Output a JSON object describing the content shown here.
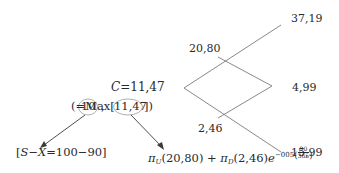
{
  "diagram": {
    "type": "binomial-tree",
    "root": {
      "label": "C = 11.47",
      "c_symbol": "C",
      "c_eq": "=",
      "c_value": "11,47",
      "note": {
        "open": "(",
        "eq": "=",
        "max": "Max[",
        "opt1": "10",
        "comma": ",",
        "opt2": "11,47",
        "close": "])"
      }
    },
    "nodes": {
      "up": "20,80",
      "down": "2,46",
      "uu": "37,19",
      "ud": "4,99",
      "dd": "15,99"
    },
    "annotations": {
      "exercise": {
        "text": "[S−X=100−90]",
        "open": "[",
        "s": "S",
        "minus1": "−",
        "x": "X",
        "eq": "=",
        "values": "100−90",
        "close": "]"
      },
      "hold": {
        "pi_u": "π",
        "sub_u": "U",
        "arg_u": "(20,80)",
        "plus": "+",
        "pi_d": "π",
        "sub_d": "D",
        "arg_d": "(2,46)",
        "e": "e",
        "exp": "−005",
        "frac_num": "90",
        "frac_den": "365"
      }
    },
    "colors": {
      "line": "#7a7a7a",
      "text": "#2a2a2a",
      "circle": "#9a9a9a"
    }
  }
}
